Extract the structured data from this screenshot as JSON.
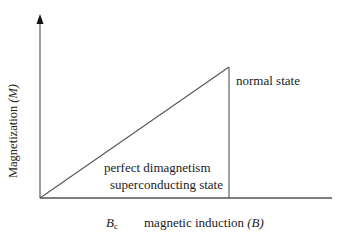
{
  "diagram": {
    "type": "magnetization_vs_induction_superconductor",
    "y_axis": {
      "label_text": "Magnetization ",
      "label_symbol": "(M)"
    },
    "x_axis": {
      "critical_field_symbol": "B",
      "critical_field_subscript": "c",
      "label_text": "magnetic induction ",
      "label_symbol": "(B)"
    },
    "regions": {
      "normal": "normal state",
      "superconducting_line1": "perfect dimagnetism",
      "superconducting_line2": "superconducting state"
    },
    "geometry": {
      "origin": [
        40,
        198
      ],
      "y_axis_top": [
        40,
        15
      ],
      "x_axis_end": [
        332,
        198
      ],
      "peak": [
        229,
        67
      ]
    },
    "colors": {
      "line": "#555555",
      "text": "#222222",
      "background": "#ffffff"
    }
  }
}
